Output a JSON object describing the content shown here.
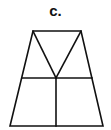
{
  "figure": {
    "label": "c.",
    "stroke_color": "#111111",
    "background": "#ffffff",
    "shape": "trapezoid divided by horizontal midline, vertical lower bisector, and V from top corners to center"
  }
}
